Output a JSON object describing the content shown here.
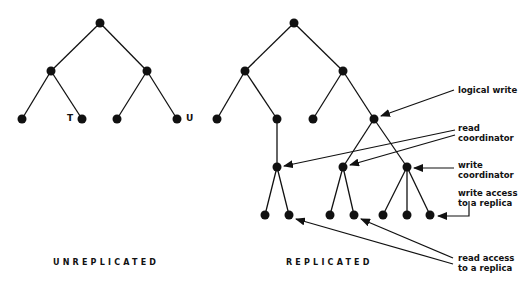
{
  "figure": {
    "unreplicated": {
      "caption": "UNREPLICATED",
      "leaf_labels": {
        "t": "T",
        "u": "U"
      }
    },
    "replicated": {
      "caption": "REPLICATED",
      "annotations": {
        "logical_write": "logical write",
        "read_coordinator_1": "read",
        "read_coordinator_2": "coordinator",
        "write_coordinator_1": "write",
        "write_coordinator_2": "coordinator",
        "write_access_1": "write access",
        "write_access_2": "to a replica",
        "read_access_1": "read access",
        "read_access_2": "to a replica"
      }
    },
    "colors": {
      "ink": "#111111",
      "background": "#ffffff"
    }
  }
}
